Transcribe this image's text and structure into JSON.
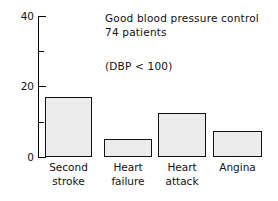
{
  "chart_data": {
    "type": "bar",
    "title": "",
    "annotations": [
      "Good blood pressure control",
      "74 patients",
      "(DBP < 100)"
    ],
    "categories": [
      "Second stroke",
      "Heart failure",
      "Heart attack",
      "Angina"
    ],
    "category_lines": [
      [
        "Second",
        "stroke"
      ],
      [
        "Heart",
        "failure"
      ],
      [
        "Heart",
        "attack"
      ],
      [
        "Angina",
        ""
      ]
    ],
    "values": [
      17,
      5,
      12.5,
      7.5
    ],
    "xlabel": "",
    "ylabel": "",
    "ylim": [
      0,
      40
    ],
    "yticks": [
      0,
      20,
      40
    ],
    "ytick_labels": [
      "0",
      "20",
      "40"
    ],
    "yminor_ticks": [
      10,
      30
    ],
    "grid": false,
    "legend": null,
    "bar_fill_color": "#ececec",
    "bar_edge_color": "#111111",
    "axis_color": "#000000",
    "background_color": "#ffffff"
  },
  "figure": {
    "annotation_line_1": "Good blood pressure control",
    "annotation_line_2": "74 patients",
    "annotation_line_3": "(DBP < 100)"
  },
  "axis": {
    "tick_label_40": "40",
    "tick_label_20": "20",
    "tick_label_0": "0"
  },
  "bars": [
    {
      "label_line_1": "Second",
      "label_line_2": "stroke",
      "value": 17
    },
    {
      "label_line_1": "Heart",
      "label_line_2": "failure",
      "value": 5
    },
    {
      "label_line_1": "Heart",
      "label_line_2": "attack",
      "value": 12.5
    },
    {
      "label_line_1": "Angina",
      "label_line_2": "",
      "value": 7.5
    }
  ]
}
